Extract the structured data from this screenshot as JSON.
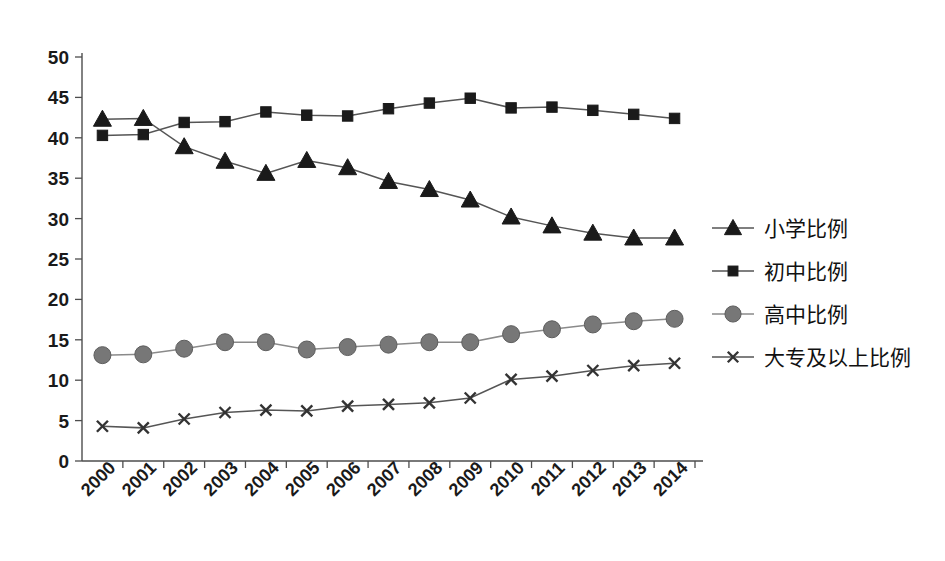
{
  "chart_data": {
    "type": "line",
    "title": "",
    "xlabel": "",
    "ylabel": "",
    "categories": [
      "2000",
      "2001",
      "2002",
      "2003",
      "2004",
      "2005",
      "2006",
      "2007",
      "2008",
      "2009",
      "2010",
      "2011",
      "2012",
      "2013",
      "2014"
    ],
    "x": [
      2000,
      2001,
      2002,
      2003,
      2004,
      2005,
      2006,
      2007,
      2008,
      2009,
      2010,
      2011,
      2012,
      2013,
      2014
    ],
    "ylim": [
      0,
      50
    ],
    "yticks": [
      0,
      5,
      10,
      15,
      20,
      25,
      30,
      35,
      40,
      45,
      50
    ],
    "ytick_labels": [
      "0",
      "5",
      "10",
      "15",
      "20",
      "25",
      "30",
      "35",
      "40",
      "45",
      "50"
    ],
    "grid": false,
    "legend_position": "right",
    "series": [
      {
        "name": "小学比例",
        "marker": "triangle",
        "color": "#1a1a1a",
        "values": [
          42.3,
          42.4,
          38.9,
          37.1,
          35.6,
          37.2,
          36.3,
          34.6,
          33.6,
          32.3,
          30.2,
          29.1,
          28.2,
          27.6,
          27.6
        ]
      },
      {
        "name": "初中比例",
        "marker": "square",
        "color": "#1a1a1a",
        "values": [
          40.3,
          40.4,
          41.9,
          42.0,
          43.2,
          42.8,
          42.7,
          43.6,
          44.3,
          44.9,
          43.7,
          43.8,
          43.4,
          42.9,
          42.4
        ]
      },
      {
        "name": "高中比例",
        "marker": "circle",
        "color": "#777777",
        "values": [
          13.1,
          13.2,
          13.9,
          14.7,
          14.7,
          13.8,
          14.1,
          14.4,
          14.7,
          14.7,
          15.7,
          16.3,
          16.9,
          17.3,
          17.6
        ]
      },
      {
        "name": "大专及以上比例",
        "marker": "x",
        "color": "#333333",
        "values": [
          4.3,
          4.1,
          5.2,
          6.0,
          6.3,
          6.2,
          6.8,
          7.0,
          7.2,
          7.8,
          10.1,
          10.5,
          11.2,
          11.8,
          12.1
        ]
      }
    ]
  },
  "legend": {
    "items": [
      {
        "label": "小学比例",
        "marker": "triangle",
        "color": "#1a1a1a"
      },
      {
        "label": "初中比例",
        "marker": "square",
        "color": "#1a1a1a"
      },
      {
        "label": "高中比例",
        "marker": "circle",
        "color": "#777777"
      },
      {
        "label": "大专及以上比例",
        "marker": "x",
        "color": "#333333"
      }
    ]
  },
  "axes": {
    "y_tick_labels": [
      "50",
      "45",
      "40",
      "35",
      "30",
      "25",
      "20",
      "15",
      "10",
      "5",
      "0"
    ],
    "x_tick_labels": [
      "2000",
      "2001",
      "2002",
      "2003",
      "2004",
      "2005",
      "2006",
      "2007",
      "2008",
      "2009",
      "2010",
      "2011",
      "2012",
      "2013",
      "2014"
    ]
  }
}
